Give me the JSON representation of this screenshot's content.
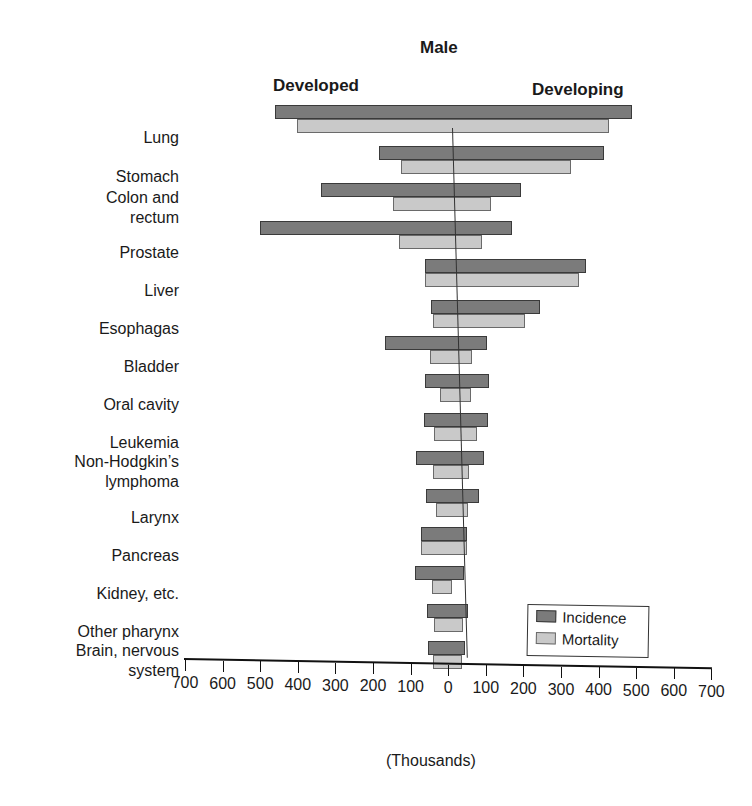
{
  "chart_data": {
    "type": "bar",
    "subtype": "butterfly-horizontal",
    "title": "Male",
    "left_panel_label": "Developed",
    "right_panel_label": "Developing",
    "xlabel": "(Thousands)",
    "xlim": [
      -700,
      700
    ],
    "x_ticks": [
      "700",
      "600",
      "500",
      "400",
      "300",
      "200",
      "100",
      "0",
      "100",
      "200",
      "300",
      "400",
      "500",
      "600",
      "700"
    ],
    "legend": [
      "Incidence",
      "Mortality"
    ],
    "legend_position": "lower right",
    "colors": {
      "Incidence": "#7b7b7b",
      "Mortality": "#c9c9c9"
    },
    "categories": [
      "Lung",
      "Stomach",
      "Colon and rectum",
      "Prostate",
      "Liver",
      "Esophagas",
      "Bladder",
      "Oral cavity",
      "Leukemia",
      "Non-Hodgkin's lymphoma",
      "Larynx",
      "Pancreas",
      "Kidney, etc.",
      "Other pharynx",
      "Brain, nervous system"
    ],
    "series": [
      {
        "name": "Incidence - Developed",
        "values": [
          480,
          200,
          350,
          510,
          70,
          50,
          170,
          60,
          60,
          80,
          50,
          60,
          75,
          40,
          35
        ]
      },
      {
        "name": "Incidence - Developing",
        "values": [
          470,
          400,
          180,
          160,
          360,
          240,
          100,
          110,
          110,
          100,
          90,
          60,
          55,
          70,
          65
        ]
      },
      {
        "name": "Mortality - Developed",
        "values": [
          420,
          140,
          160,
          140,
          70,
          45,
          50,
          20,
          35,
          35,
          25,
          60,
          30,
          20,
          20
        ]
      },
      {
        "name": "Mortality - Developing",
        "values": [
          410,
          310,
          100,
          80,
          340,
          200,
          60,
          60,
          80,
          60,
          60,
          60,
          25,
          55,
          55
        ]
      }
    ]
  },
  "labels": {
    "title": "Male",
    "developed": "Developed",
    "developing": "Developing",
    "xlabel": "(Thousands)",
    "legend_incidence": "Incidence",
    "legend_mortality": "Mortality"
  }
}
